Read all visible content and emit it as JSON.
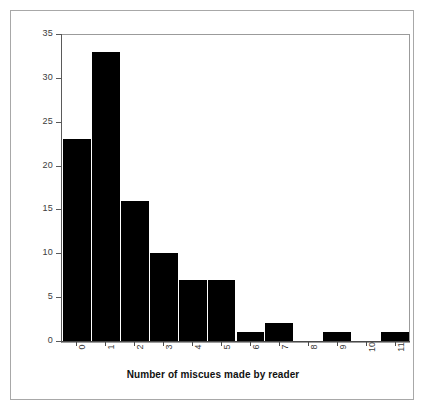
{
  "chart_data": {
    "type": "bar",
    "title": "",
    "xlabel": "Number of miscues made by reader",
    "ylabel": "",
    "categories": [
      "0",
      "1",
      "2",
      "3",
      "4",
      "5",
      "6",
      "7",
      "8",
      "9",
      "10",
      "11"
    ],
    "values": [
      23,
      33,
      16,
      10,
      7,
      7,
      1,
      2,
      0,
      1,
      0,
      1
    ],
    "series": [
      {
        "name": "Frequency",
        "values": [
          23,
          33,
          16,
          10,
          7,
          7,
          1,
          2,
          0,
          1,
          0,
          1
        ]
      }
    ],
    "ylim": [
      0,
      35
    ],
    "yticks": [
      0,
      5,
      10,
      15,
      20,
      25,
      30,
      35
    ],
    "ytick_labels": [
      "0",
      "5",
      "10",
      "15",
      "20",
      "25",
      "30",
      "35"
    ],
    "xtick_labels": [
      "0",
      "1",
      "2",
      "3",
      "4",
      "5",
      "6",
      "7",
      "8",
      "9",
      "10",
      "11"
    ],
    "xtick_label_rotation": 90,
    "grid": false,
    "legend": false,
    "legend_position": "none",
    "bar_color": "#000000",
    "bar_edge_color": "#ffffff",
    "plot_border_color": "#9b9b9b",
    "axis_color": "#5a5a5a",
    "tick_label_color": "#3c3c3c",
    "figure_background": "#ffffff",
    "figure_frame_color": "#a8a8a8"
  }
}
